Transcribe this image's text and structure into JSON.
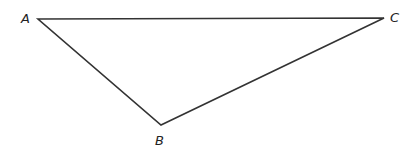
{
  "diagram": {
    "type": "triangle",
    "vertices": [
      {
        "label": "A",
        "x": 38,
        "y": 19
      },
      {
        "label": "B",
        "x": 161,
        "y": 125
      },
      {
        "label": "C",
        "x": 384,
        "y": 18
      }
    ],
    "stroke_color": "#333333"
  }
}
